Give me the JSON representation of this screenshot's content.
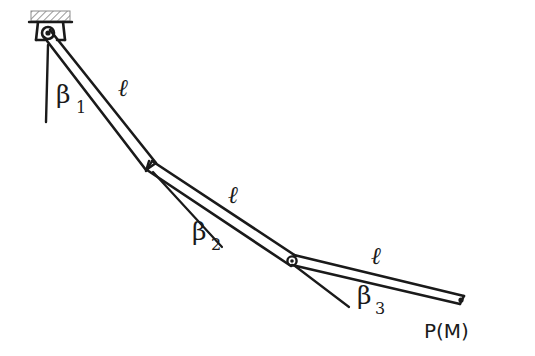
{
  "figure": {
    "background_color": "#ffffff",
    "line_color": "#1a1a1a",
    "hatch_color": "#b3b3b3",
    "width": 535,
    "height": 356
  },
  "support": {
    "name": "fixed-ceiling-support",
    "hatch_bar": {
      "x": 31,
      "y": 11,
      "width": 39,
      "height": 10
    },
    "bracket": {
      "x": 33,
      "y": 21,
      "width": 35,
      "height": 19
    },
    "pivot": {
      "cx": 48,
      "cy": 33,
      "r": 5.5
    }
  },
  "joints": [
    {
      "name": "joint-0-pivot",
      "label": "O",
      "x": 48,
      "y": 33
    },
    {
      "name": "joint-1",
      "label": "",
      "x": 150,
      "y": 166
    },
    {
      "name": "joint-2",
      "label": "",
      "x": 292,
      "y": 261
    },
    {
      "name": "end-point",
      "label": "P(M)",
      "x": 461,
      "y": 300
    }
  ],
  "links": [
    {
      "name": "link-1",
      "length_label": "ℓ",
      "from": 0,
      "to": 1,
      "label_x": 123,
      "label_y": 96
    },
    {
      "name": "link-2",
      "length_label": "ℓ",
      "from": 1,
      "to": 2,
      "label_x": 233,
      "label_y": 203
    },
    {
      "name": "link-3",
      "length_label": "ℓ",
      "from": 2,
      "to": 3,
      "label_x": 376,
      "label_y": 264
    }
  ],
  "angles": [
    {
      "name": "angle-beta-1",
      "symbol": "β",
      "subscript": "1",
      "label_x": 56,
      "label_y": 103,
      "sub_x": 76,
      "sub_y": 113,
      "reference_line": {
        "x1": 48,
        "y1": 45,
        "x2": 46,
        "y2": 122
      }
    },
    {
      "name": "angle-beta-2",
      "symbol": "β",
      "subscript": "2",
      "label_x": 192,
      "label_y": 240,
      "sub_x": 211,
      "sub_y": 250,
      "reference_line": {
        "x1": 153,
        "y1": 172,
        "x2": 222,
        "y2": 247
      }
    },
    {
      "name": "angle-beta-3",
      "symbol": "β",
      "subscript": "3",
      "label_x": 357,
      "label_y": 304,
      "sub_x": 375,
      "sub_y": 314,
      "reference_line": {
        "x1": 295,
        "y1": 266,
        "x2": 349,
        "y2": 307
      }
    }
  ],
  "end_label": {
    "name": "end-point-label",
    "text": "P(M)",
    "x": 424,
    "y": 338
  }
}
